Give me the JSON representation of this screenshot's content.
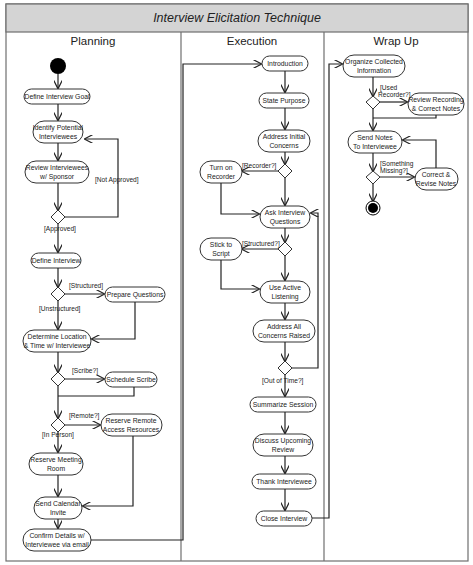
{
  "title": "Interview Elicitation Technique",
  "lanes": [
    {
      "name": "Planning"
    },
    {
      "name": "Execution"
    },
    {
      "name": "Wrap Up"
    }
  ],
  "nodes": {
    "define_goal": {
      "lines": [
        "Define Interview Goal"
      ]
    },
    "identify": {
      "lines": [
        "Identify Potential",
        "Interviewees"
      ]
    },
    "review_sponsor": {
      "lines": [
        "Review Interviewees",
        "w/ Sponsor"
      ]
    },
    "define_interview": {
      "lines": [
        "Define Interview"
      ]
    },
    "prepare_questions": {
      "lines": [
        "Prepare Questions"
      ]
    },
    "determine_location": {
      "lines": [
        "Determine Location",
        "& Time w/ Interviewee"
      ]
    },
    "schedule_scribe": {
      "lines": [
        "Schedule Scribe"
      ]
    },
    "reserve_remote": {
      "lines": [
        "Reserve Remote",
        "Access Resources"
      ]
    },
    "reserve_room": {
      "lines": [
        "Reserve Meeting",
        "Room"
      ]
    },
    "send_invite": {
      "lines": [
        "Send Calendar",
        "Invite"
      ]
    },
    "confirm_details": {
      "lines": [
        "Confirm Details w/",
        "Interviewee via email"
      ]
    },
    "introduction": {
      "lines": [
        "Introduction"
      ]
    },
    "state_purpose": {
      "lines": [
        "State Purpose"
      ]
    },
    "address_initial": {
      "lines": [
        "Address Initial",
        "Concerns"
      ]
    },
    "turn_on_recorder": {
      "lines": [
        "Turn on",
        "Recorder"
      ]
    },
    "ask_questions": {
      "lines": [
        "Ask Interview",
        "Questions"
      ]
    },
    "stick_to_script": {
      "lines": [
        "Stick to",
        "Script"
      ]
    },
    "active_listening": {
      "lines": [
        "Use Active",
        "Listening"
      ]
    },
    "address_all": {
      "lines": [
        "Address All",
        "Concerns Raised"
      ]
    },
    "summarize": {
      "lines": [
        "Summarize Session"
      ]
    },
    "discuss_review": {
      "lines": [
        "Discuss Upcoming",
        "Review"
      ]
    },
    "thank": {
      "lines": [
        "Thank Interviewee"
      ]
    },
    "close": {
      "lines": [
        "Close Interview"
      ]
    },
    "organize": {
      "lines": [
        "Organize Collected",
        "Information"
      ]
    },
    "review_recording": {
      "lines": [
        "Review Recording",
        "& Correct Notes"
      ]
    },
    "send_notes": {
      "lines": [
        "Send Notes",
        "To Interviewee"
      ]
    },
    "correct_revise": {
      "lines": [
        "Correct &",
        "Revise Notes"
      ]
    }
  },
  "guards": {
    "not_approved": "[Not Approved]",
    "approved": "[Approved]",
    "structured": "[Structured]",
    "unstructured": "[Unstructured]",
    "scribe": "[Scribe?]",
    "remote": "[Remote?]",
    "in_person": "[In Person]",
    "recorder": "[Recorder?]",
    "structured_q": "[Structured?]",
    "out_of_time": "[Out of Time?]",
    "used_recorder_1": "[Used",
    "used_recorder_2": "Recorder?]",
    "something_missing_1": "[Something",
    "something_missing_2": "Missing?]"
  },
  "icons": {
    "start": "initial-node",
    "end": "final-node",
    "decision": "decision-diamond"
  }
}
